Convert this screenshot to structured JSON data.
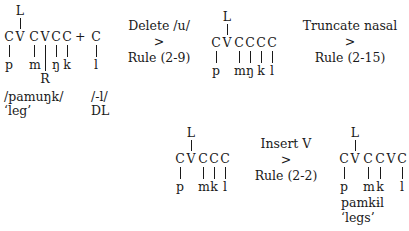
{
  "diagram": {
    "stage1": {
      "L": "L",
      "skeleton": [
        "C",
        "V",
        "C",
        "V",
        "C",
        "C"
      ],
      "plus": "+",
      "suffix_C": "C",
      "segments": [
        "p",
        "m",
        "ŋ",
        "k"
      ],
      "suffix_segment": "l",
      "R": "R",
      "form": "/pamuŋk/",
      "gloss": "‘leg’",
      "suffix_form": "/-l/",
      "suffix_gloss": "DL"
    },
    "rule1": {
      "line1": "Delete /u/",
      "arrow": ">",
      "line2": "Rule (2-9)"
    },
    "stage2": {
      "L": "L",
      "skeleton": [
        "C",
        "V",
        "C",
        "C",
        "C",
        "C"
      ],
      "segments": [
        "p",
        "m",
        "ŋ",
        "k",
        "l"
      ]
    },
    "rule2": {
      "line1": "Truncate nasal",
      "arrow": ">",
      "line2": "Rule (2-15)"
    },
    "stage3": {
      "L": "L",
      "skeleton": [
        "C",
        "V",
        "C",
        "C",
        "C"
      ],
      "segments": [
        "p",
        "m",
        "k",
        "l"
      ]
    },
    "rule3": {
      "line1": "Insert V",
      "arrow": ">",
      "line2": "Rule (2-2)"
    },
    "stage4": {
      "L": "L",
      "skeleton": [
        "C",
        "V",
        "C",
        "C",
        "V",
        "C"
      ],
      "segments": [
        "p",
        "m",
        "k",
        "l"
      ],
      "form": "pamkɨl",
      "gloss": "‘legs’"
    }
  }
}
